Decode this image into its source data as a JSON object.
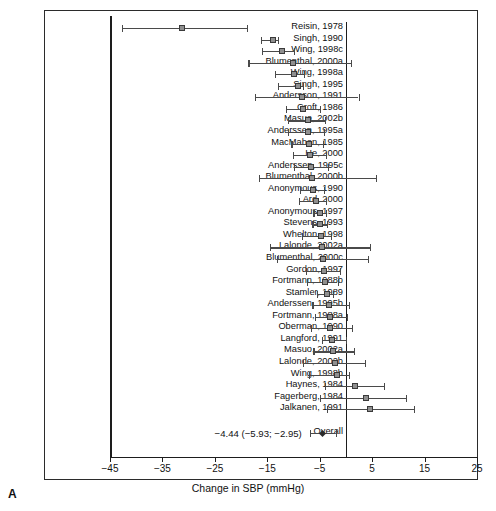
{
  "panel": {
    "letter": "A"
  },
  "axis": {
    "title": "Change in SBP (mmHg)",
    "min": -45,
    "max": 25,
    "ticks": [
      -45,
      -35,
      -25,
      -15,
      -5,
      5,
      15,
      25
    ],
    "tick_labels": [
      "−45",
      "−35",
      "−25",
      "−15",
      "−5",
      "5",
      "15",
      "25"
    ],
    "zero_reference": 0
  },
  "overall": {
    "label": "Overall",
    "text": "−4.44 (−5.93; −2.95)",
    "estimate": -4.44,
    "ci_low": -5.93,
    "ci_high": -2.95
  },
  "chart_data": {
    "type": "forest",
    "title": "",
    "xlabel": "Change in SBP (mmHg)",
    "ylabel": "",
    "xlim": [
      -45,
      25
    ],
    "grid": false,
    "legend": "none",
    "reference_line": 0,
    "categories": [
      "Reisin, 1978",
      "Singh, 1990",
      "Wing, 1998c",
      "Blumenthal, 2000a",
      "Wing, 1998a",
      "Singh, 1995",
      "Andersson, 1991",
      "Croft, 1986",
      "Masuo, 2002b",
      "Anderssen, 1995a",
      "MacMahon, 1985",
      "He, 2000",
      "Anderssen, 1995c",
      "Blumenthal, 2000b",
      "Anonymous, 1990",
      "Ard, 2000",
      "Anonymous, 1997",
      "Stevens, 1993",
      "Whelton, 1998",
      "Lalonde, 2002a",
      "Blumenthal, 2000c",
      "Gordon, 1997",
      "Fortmann, 1988b",
      "Stamler, 1989",
      "Anderssen, 1995b",
      "Fortmann, 1988a",
      "Oberman, 1990",
      "Langford, 1991",
      "Masuo, 2002a",
      "Lalonde, 2002b",
      "Wing, 1998b",
      "Haynes, 1984",
      "Fagerberg, 1984",
      "Jalkanen, 1991"
    ],
    "studies": [
      {
        "label": "Reisin, 1978",
        "estimate": -31.2,
        "ci_low": -42.8,
        "ci_high": -18.9
      },
      {
        "label": "Singh, 1990",
        "estimate": -14.0,
        "ci_low": -16.2,
        "ci_high": -13.0
      },
      {
        "label": "Wing, 1998c",
        "estimate": -12.2,
        "ci_low": -16.0,
        "ci_high": -10.0
      },
      {
        "label": "Blumenthal, 2000a",
        "estimate": -10.2,
        "ci_low": -18.6,
        "ci_high": 0.9
      },
      {
        "label": "Wing, 1998a",
        "estimate": -10.0,
        "ci_low": -13.5,
        "ci_high": -8.0
      },
      {
        "label": "Singh, 1995",
        "estimate": -9.2,
        "ci_low": -13.0,
        "ci_high": -8.2
      },
      {
        "label": "Andersson, 1991",
        "estimate": -8.4,
        "ci_low": -17.4,
        "ci_high": 2.4
      },
      {
        "label": "Croft, 1986",
        "estimate": -8.2,
        "ci_low": -11.5,
        "ci_high": -5.0
      },
      {
        "label": "Masuo, 2002b",
        "estimate": -7.2,
        "ci_low": -11.0,
        "ci_high": -4.0
      },
      {
        "label": "Anderssen, 1995a",
        "estimate": -7.2,
        "ci_low": -11.0,
        "ci_high": -4.2
      },
      {
        "label": "MacMahon, 1985",
        "estimate": -7.0,
        "ci_low": -10.4,
        "ci_high": -4.4
      },
      {
        "label": "He, 2000",
        "estimate": -6.8,
        "ci_low": -10.2,
        "ci_high": -3.8
      },
      {
        "label": "Anderssen, 1995c",
        "estimate": -6.6,
        "ci_low": -10.0,
        "ci_high": -3.5
      },
      {
        "label": "Blumenthal, 2000b",
        "estimate": -6.4,
        "ci_low": -16.6,
        "ci_high": 5.8
      },
      {
        "label": "Anonymous, 1990",
        "estimate": -6.2,
        "ci_low": -8.8,
        "ci_high": -4.2
      },
      {
        "label": "Ard, 2000",
        "estimate": -5.8,
        "ci_low": -9.0,
        "ci_high": -3.8
      },
      {
        "label": "Anonymous, 1997",
        "estimate": -5.0,
        "ci_low": -6.2,
        "ci_high": -3.8
      },
      {
        "label": "Stevens, 1993",
        "estimate": -5.0,
        "ci_low": -6.4,
        "ci_high": -3.6
      },
      {
        "label": "Whelton, 1998",
        "estimate": -4.8,
        "ci_low": -8.4,
        "ci_high": -2.8
      },
      {
        "label": "Lalonde, 2002a",
        "estimate": -4.6,
        "ci_low": -14.5,
        "ci_high": 4.6
      },
      {
        "label": "Blumenthal, 2000c",
        "estimate": -4.4,
        "ci_low": -13.2,
        "ci_high": 4.2
      },
      {
        "label": "Gordon, 1997",
        "estimate": -4.2,
        "ci_low": -7.6,
        "ci_high": -1.2
      },
      {
        "label": "Fortmann, 1988b",
        "estimate": -4.0,
        "ci_low": -7.4,
        "ci_high": -1.6
      },
      {
        "label": "Stamler, 1989",
        "estimate": -3.6,
        "ci_low": -5.6,
        "ci_high": -2.4
      },
      {
        "label": "Anderssen, 1995b",
        "estimate": -3.2,
        "ci_low": -6.4,
        "ci_high": 0.6
      },
      {
        "label": "Fortmann, 1988a",
        "estimate": -3.0,
        "ci_low": -6.0,
        "ci_high": 0.2
      },
      {
        "label": "Oberman, 1990",
        "estimate": -3.0,
        "ci_low": -6.6,
        "ci_high": 1.2
      },
      {
        "label": "Langford, 1991",
        "estimate": -2.6,
        "ci_low": -4.6,
        "ci_high": 0.0
      },
      {
        "label": "Masuo, 2002a",
        "estimate": -2.4,
        "ci_low": -6.2,
        "ci_high": 1.6
      },
      {
        "label": "Lalonde, 2002b",
        "estimate": -2.0,
        "ci_low": -8.2,
        "ci_high": 3.6
      },
      {
        "label": "Wing, 1998b",
        "estimate": -1.8,
        "ci_low": -7.0,
        "ci_high": 0.6
      },
      {
        "label": "Haynes, 1984",
        "estimate": 1.8,
        "ci_low": -4.0,
        "ci_high": 7.2
      },
      {
        "label": "Fagerberg, 1984",
        "estimate": 3.8,
        "ci_low": -5.0,
        "ci_high": 11.4
      },
      {
        "label": "Jalkanen, 1991",
        "estimate": 4.6,
        "ci_low": -3.6,
        "ci_high": 13.0
      }
    ],
    "overall": {
      "label": "Overall",
      "estimate": -4.44,
      "ci_low": -5.93,
      "ci_high": -2.95,
      "text": "−4.44 (−5.93; −2.95)"
    }
  }
}
